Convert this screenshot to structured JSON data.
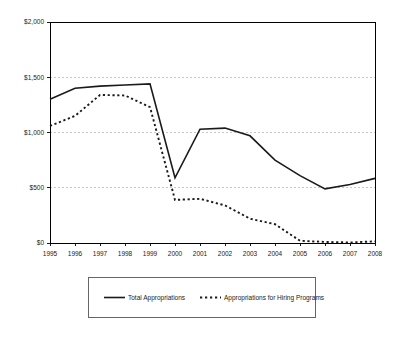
{
  "chart_data": {
    "type": "line",
    "title": "",
    "subtitle": "",
    "xlabel": "",
    "ylabel": "",
    "grid": "horizontal",
    "legend_position": "bottom",
    "xlim": [
      1995,
      2008
    ],
    "ylim": [
      0,
      2000
    ],
    "categories": [
      1995,
      1996,
      1997,
      1998,
      1999,
      2000,
      2001,
      2002,
      2003,
      2004,
      2005,
      2006,
      2007,
      2008
    ],
    "xtick_labels": [
      "1995",
      "1996",
      "1997",
      "1998",
      "1999",
      "2000",
      "2001",
      "2002",
      "2003",
      "2004",
      "2005",
      "2006",
      "2007",
      "2008"
    ],
    "ytick_values": [
      0,
      500,
      1000,
      1500,
      2000
    ],
    "ytick_labels": [
      "$0",
      "$500",
      "$1,000",
      "$1,500",
      "$2,000"
    ],
    "series": [
      {
        "name": "Total Appropriations",
        "style": "solid",
        "color": "#1a1a1a",
        "values": [
          1300,
          1400,
          1420,
          1430,
          1440,
          590,
          1030,
          1040,
          970,
          750,
          610,
          490,
          530,
          585
        ]
      },
      {
        "name": "Appropriations for Hiring Programs",
        "style": "dashed",
        "color": "#1a1a1a",
        "values": [
          1060,
          1150,
          1340,
          1335,
          1230,
          390,
          400,
          340,
          220,
          170,
          20,
          10,
          5,
          15
        ]
      }
    ],
    "annotations": []
  },
  "legend": {
    "items": [
      {
        "label": "Total Appropriations",
        "style": "solid"
      },
      {
        "label": "Appropriations for Hiring Programs",
        "style": "dashed"
      }
    ]
  },
  "colors": {
    "series_line": "#1a1a1a",
    "gridline": "#b9b9b9",
    "axis": "#000000",
    "legend_border": "#555555",
    "background": "#ffffff"
  }
}
